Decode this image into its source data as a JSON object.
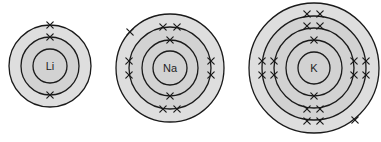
{
  "diagram": {
    "title": "Electron shell diagrams of Li, Na and K",
    "colors": {
      "line": "#1a1a1a",
      "outer_fill": "#dedede",
      "inner_fill": "#d2d2d2",
      "background": "#ffffff"
    },
    "atoms": [
      {
        "symbol": "Li",
        "center": [
          50,
          66
        ],
        "outer_radius": 41,
        "shells": [
          17,
          29
        ],
        "electrons_per_shell": [
          2,
          1
        ],
        "electrons": [
          [
            50,
            37
          ],
          [
            50,
            95
          ],
          [
            50,
            25
          ]
        ]
      },
      {
        "symbol": "Na",
        "center": [
          170,
          68
        ],
        "outer_radius": 54,
        "shells": [
          17,
          28,
          41
        ],
        "electrons_per_shell": [
          2,
          8,
          1
        ],
        "electrons": [
          [
            170,
            40
          ],
          [
            170,
            96
          ],
          [
            163,
            27
          ],
          [
            177,
            27
          ],
          [
            163,
            109
          ],
          [
            177,
            109
          ],
          [
            129,
            61
          ],
          [
            129,
            75
          ],
          [
            211,
            61
          ],
          [
            211,
            75
          ],
          [
            130,
            32
          ]
        ]
      },
      {
        "symbol": "K",
        "center": [
          314,
          68
        ],
        "outer_radius": 65,
        "shells": [
          16,
          28,
          40,
          52
        ],
        "electrons_per_shell": [
          2,
          8,
          8,
          1
        ],
        "electrons": [
          [
            314,
            40
          ],
          [
            314,
            96
          ],
          [
            307,
            26
          ],
          [
            320,
            26
          ],
          [
            307,
            109
          ],
          [
            320,
            109
          ],
          [
            274,
            61
          ],
          [
            274,
            75
          ],
          [
            354,
            61
          ],
          [
            354,
            75
          ],
          [
            307,
            14
          ],
          [
            320,
            14
          ],
          [
            307,
            121
          ],
          [
            320,
            121
          ],
          [
            262,
            61
          ],
          [
            262,
            75
          ],
          [
            366,
            61
          ],
          [
            366,
            75
          ],
          [
            355,
            120
          ]
        ]
      }
    ]
  }
}
